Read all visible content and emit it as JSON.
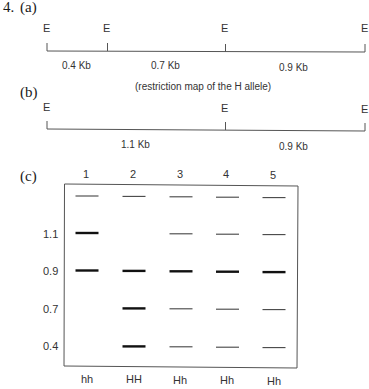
{
  "question_number": "4.",
  "part_a": {
    "label": "(a)",
    "site_label": "E",
    "fragments": [
      {
        "label": "0.4 Kb",
        "size_kb": 0.4
      },
      {
        "label": "0.7 Kb",
        "size_kb": 0.7
      },
      {
        "label": "0.9 Kb",
        "size_kb": 0.9
      }
    ],
    "caption": "(restriction map of the H allele)"
  },
  "part_b": {
    "label": "(b)",
    "site_label": "E",
    "fragments": [
      {
        "label": "1.1 Kb",
        "size_kb": 1.1
      },
      {
        "label": "0.9 Kb",
        "size_kb": 0.9
      }
    ]
  },
  "part_c": {
    "label": "(c)",
    "lanes": [
      {
        "number": "1",
        "genotype": "hh",
        "bands": {
          "top": "thin",
          "1.1": "thick",
          "0.9": "thick",
          "0.7": null,
          "0.4": null
        }
      },
      {
        "number": "2",
        "genotype": "HH",
        "bands": {
          "top": "thin",
          "1.1": null,
          "0.9": "thick",
          "0.7": "thick",
          "0.4": "thick"
        }
      },
      {
        "number": "3",
        "genotype": "Hh",
        "bands": {
          "top": "thin",
          "1.1": "thin",
          "0.9": "thick",
          "0.7": "thin",
          "0.4": "thin"
        }
      },
      {
        "number": "4",
        "genotype": "Hh",
        "bands": {
          "top": "thin",
          "1.1": "thin",
          "0.9": "thick",
          "0.7": "thin",
          "0.4": "thin"
        }
      },
      {
        "number": "5",
        "genotype": "Hh",
        "bands": {
          "top": "thin",
          "1.1": "thin",
          "0.9": "thick",
          "0.7": "thin",
          "0.4": "thin"
        }
      }
    ],
    "size_markers": [
      "1.1",
      "0.9",
      "0.7",
      "0.4"
    ]
  }
}
